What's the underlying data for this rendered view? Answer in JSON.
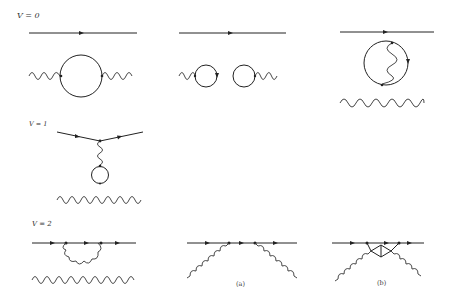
{
  "figure": {
    "rows": [
      {
        "label": "V = 0",
        "diagrams": [
          {
            "id": "v0-a",
            "description": "free fermion line with arrow; photon line with single fermion loop (vacuum polarization bubble)"
          },
          {
            "id": "v0-b",
            "description": "free fermion line with arrow; two disconnected tadpole loops each attached to a photon line"
          },
          {
            "id": "v0-c",
            "description": "free fermion line with arrow; fermion loop with internal photon exchange; free photon line"
          }
        ]
      },
      {
        "label": "V = 1",
        "diagrams": [
          {
            "id": "v1-a",
            "description": "fermion-photon vertex with photon connecting to a tadpole loop; free photon line"
          }
        ]
      },
      {
        "label": "V = 2",
        "diagrams": [
          {
            "id": "v2-a",
            "description": "fermion self-energy: photon emitted and reabsorbed on fermion line; free photon line"
          },
          {
            "id": "v2-b",
            "description": "two external photons attached at two vertices on fermion line",
            "caption": "(a)"
          },
          {
            "id": "v2-c",
            "description": "two external photons attached with fermion triangle insertion",
            "caption": "(b)"
          }
        ]
      }
    ]
  }
}
